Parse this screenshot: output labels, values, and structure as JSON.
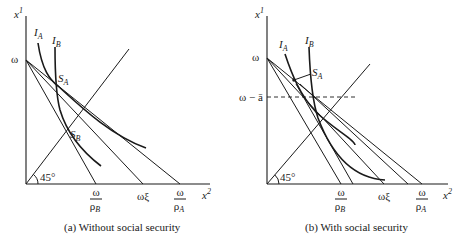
{
  "panels": [
    {
      "id": "a",
      "caption": "(a)  Without social security",
      "y_axis_label": "x",
      "y_axis_sup": "1",
      "x_axis_label": "x",
      "x_axis_sup": "2",
      "y_tick_omega": "ω",
      "angle_label": "45°",
      "x_ticks": [
        {
          "num": "ω",
          "den": "ρ",
          "den_sub": "B"
        },
        {
          "label": "ωξ"
        },
        {
          "num": "ω",
          "den": "ρ",
          "den_sub": "A"
        }
      ],
      "curves": [
        {
          "name": "I",
          "sub": "A"
        },
        {
          "name": "I",
          "sub": "B"
        }
      ],
      "points": [
        {
          "name": "S",
          "sub": "A"
        },
        {
          "name": "S",
          "sub": "B"
        }
      ]
    },
    {
      "id": "b",
      "caption": "(b)  With social security",
      "y_axis_label": "x",
      "y_axis_sup": "1",
      "x_axis_label": "x",
      "x_axis_sup": "2",
      "y_tick_omega": "ω",
      "y_tick_omega_minus_a": "ω − ā",
      "angle_label": "45°",
      "x_ticks": [
        {
          "num": "ω",
          "den": "ρ",
          "den_sub": "B"
        },
        {
          "label": "ωξ"
        },
        {
          "num": "ω",
          "den": "ρ",
          "den_sub": "A"
        }
      ],
      "curves": [
        {
          "name": "I",
          "sub": "A"
        },
        {
          "name": "I",
          "sub": "B"
        }
      ],
      "points": [
        {
          "name": "S",
          "sub": "A"
        }
      ]
    }
  ]
}
